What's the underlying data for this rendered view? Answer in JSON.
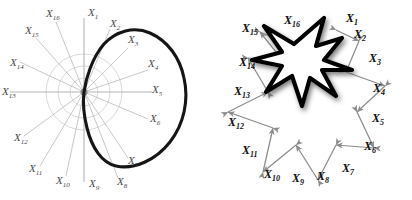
{
  "figure": {
    "background": "#ffffff",
    "width": 412,
    "height": 200,
    "panels": [
      {
        "id": "left",
        "name": "radar-polar-plot",
        "description": "Polar coordinate plot with 16 radial axes and a thick closed near-circular contour",
        "axis_color": "#b4b4b4",
        "grid_color": "#c8c8c8",
        "contour_color": "#111111",
        "label_color": "#4a4a4a",
        "center": {
          "x": 84,
          "y": 92
        },
        "grid_circles": [
          14,
          26,
          38
        ],
        "spoke_count": 16,
        "labels": [
          {
            "id": "X1",
            "base": "X",
            "sub": "1",
            "x": 88,
            "y": 16,
            "angle_deg": 90
          },
          {
            "id": "X2",
            "base": "X",
            "sub": "2",
            "x": 113,
            "y": 27,
            "angle_deg": 67.5
          },
          {
            "id": "X3",
            "base": "X",
            "sub": "3",
            "x": 131,
            "y": 43,
            "angle_deg": 45
          },
          {
            "id": "X4",
            "base": "X",
            "sub": "4",
            "x": 152,
            "y": 67,
            "angle_deg": 22.5
          },
          {
            "id": "X5",
            "base": "X",
            "sub": "5",
            "x": 155,
            "y": 93,
            "angle_deg": 0
          },
          {
            "id": "X6",
            "base": "X",
            "sub": "6",
            "x": 152,
            "y": 123,
            "angle_deg": -22.5
          },
          {
            "id": "X7",
            "base": "X",
            "sub": "7",
            "x": 131,
            "y": 163,
            "angle_deg": -45
          },
          {
            "id": "X8",
            "base": "X",
            "sub": "8",
            "x": 122,
            "y": 184,
            "angle_deg": -67.5
          },
          {
            "id": "X9",
            "base": "X",
            "sub": "9",
            "x": 94,
            "y": 186,
            "angle_deg": -90
          },
          {
            "id": "X10",
            "base": "X",
            "sub": "10",
            "x": 62,
            "y": 183,
            "angle_deg": -112.5
          },
          {
            "id": "X11",
            "base": "X",
            "sub": "11",
            "x": 35,
            "y": 172,
            "angle_deg": -135
          },
          {
            "id": "X12",
            "base": "X",
            "sub": "12",
            "x": 18,
            "y": 141,
            "angle_deg": -157.5
          },
          {
            "id": "X13",
            "base": "X",
            "sub": "13",
            "x": 4,
            "y": 95,
            "angle_deg": 180
          },
          {
            "id": "X14",
            "base": "X",
            "sub": "14",
            "x": 14,
            "y": 66,
            "angle_deg": 157.5
          },
          {
            "id": "X15",
            "base": "X",
            "sub": "15",
            "x": 29,
            "y": 34,
            "angle_deg": 135
          },
          {
            "id": "X16",
            "base": "X",
            "sub": "16",
            "x": 50,
            "y": 17,
            "angle_deg": 112.5
          }
        ]
      },
      {
        "id": "right",
        "name": "star-arrow-diagram",
        "description": "Eight-pointed gray star outline with double-headed arrows on each edge, overlaid by a smaller bold black star with drop shadow",
        "outer_star_color": "#8c8c8c",
        "inner_star_color": "#000000",
        "inner_star_fill": "#ffffff",
        "label_color": "#111111",
        "center": {
          "x": 95,
          "y": 105
        },
        "outer_points": 8,
        "inner_star_center": {
          "x": 82,
          "y": 58
        },
        "labels": [
          {
            "id": "X1",
            "base": "X",
            "sub": "1",
            "x": 145,
            "y": 22
          },
          {
            "id": "X2",
            "base": "X",
            "sub": "2",
            "x": 152,
            "y": 38
          },
          {
            "id": "X3",
            "base": "X",
            "sub": "3",
            "x": 168,
            "y": 60
          },
          {
            "id": "X4",
            "base": "X",
            "sub": "4",
            "x": 172,
            "y": 92
          },
          {
            "id": "X5",
            "base": "X",
            "sub": "5",
            "x": 171,
            "y": 122
          },
          {
            "id": "X6",
            "base": "X",
            "sub": "6",
            "x": 163,
            "y": 150
          },
          {
            "id": "X7",
            "base": "X",
            "sub": "7",
            "x": 141,
            "y": 172
          },
          {
            "id": "X8",
            "base": "X",
            "sub": "8",
            "x": 116,
            "y": 180
          },
          {
            "id": "X9",
            "base": "X",
            "sub": "9",
            "x": 91,
            "y": 181
          },
          {
            "id": "X10",
            "base": "X",
            "sub": "10",
            "x": 65,
            "y": 177
          },
          {
            "id": "X11",
            "base": "X",
            "sub": "11",
            "x": 43,
            "y": 153
          },
          {
            "id": "X12",
            "base": "X",
            "sub": "12",
            "x": 29,
            "y": 125
          },
          {
            "id": "X13",
            "base": "X",
            "sub": "13",
            "x": 34,
            "y": 94
          },
          {
            "id": "X14",
            "base": "X",
            "sub": "14",
            "x": 40,
            "y": 65
          },
          {
            "id": "X15",
            "base": "X",
            "sub": "15",
            "x": 42,
            "y": 32
          },
          {
            "id": "X16",
            "base": "X",
            "sub": "16",
            "x": 85,
            "y": 24
          }
        ]
      }
    ]
  },
  "chart_data": {
    "type": "line",
    "title": "",
    "xlabel": "",
    "ylabel": "",
    "coordinate_system": "polar",
    "categories": [
      "X1",
      "X2",
      "X3",
      "X4",
      "X5",
      "X6",
      "X7",
      "X8",
      "X9",
      "X10",
      "X11",
      "X12",
      "X13",
      "X14",
      "X15",
      "X16"
    ],
    "axis_angles_deg": [
      90,
      67.5,
      45,
      22.5,
      0,
      -22.5,
      -45,
      -67.5,
      -90,
      -112.5,
      -135,
      -157.5,
      180,
      157.5,
      135,
      112.5
    ],
    "grid": true,
    "legend": "none",
    "series": [
      {
        "name": "left-panel-contour",
        "description": "Thick closed contour, large and roughly circular on the right half, collapsing to the origin on the left half",
        "values": [
          52,
          58,
          62,
          66,
          68,
          66,
          60,
          52,
          36,
          0,
          0,
          0,
          0,
          0,
          0,
          24
        ]
      },
      {
        "name": "right-panel-outer-star",
        "description": "Gray eight-pointed star: alternating long outer spikes and short inner valleys",
        "values": [
          78,
          34,
          78,
          34,
          78,
          34,
          78,
          34,
          78,
          34,
          78,
          34,
          78,
          34,
          78,
          34
        ]
      },
      {
        "name": "right-panel-inner-star",
        "description": "Bold black eight-pointed star overlaid on the upper-left region, smaller and rotated",
        "values": [
          40,
          17,
          40,
          17,
          40,
          17,
          40,
          17,
          40,
          17,
          40,
          17,
          40,
          17,
          40,
          17
        ]
      }
    ]
  }
}
